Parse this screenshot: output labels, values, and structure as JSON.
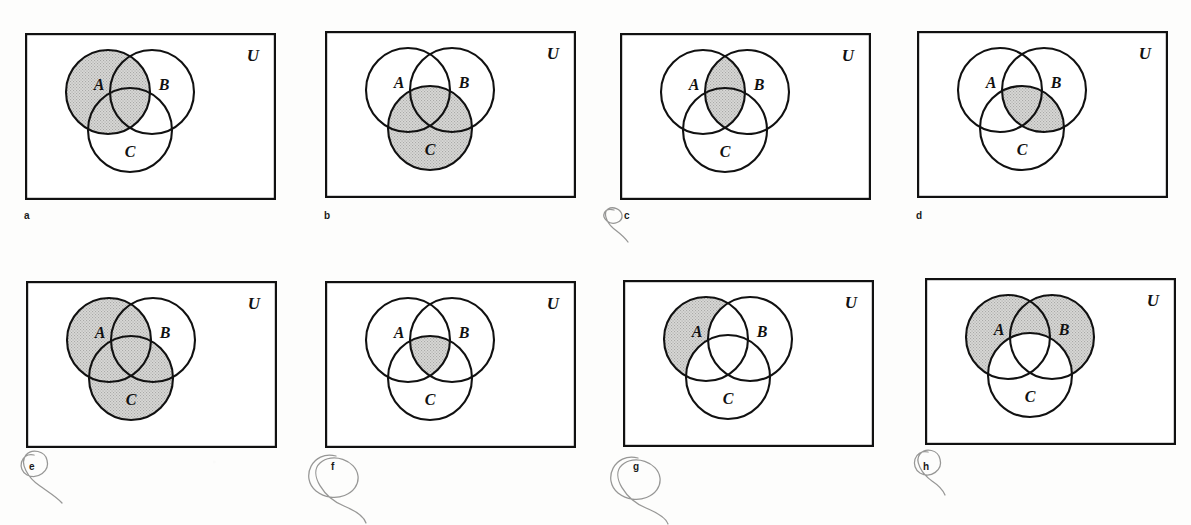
{
  "figure": {
    "kind": "venn-diagram-panel-grid",
    "panel_count": 8,
    "universe_label": "U",
    "set_labels": [
      "A",
      "B",
      "C"
    ],
    "shade_color": "#c9c9c9",
    "line_color": "#111111",
    "paper_color": "#fdfdfc"
  },
  "panels": [
    {
      "id": "a",
      "letter": "a",
      "universe_label": "U",
      "labels": {
        "a": "A",
        "b": "B",
        "c": "C"
      },
      "shaded_description": "A",
      "regions_shaded": [
        "A_only",
        "A_and_B_only",
        "A_and_C_only",
        "A_and_B_and_C"
      ],
      "box": {
        "x": 25,
        "y": 33,
        "w": 251,
        "h": 167
      },
      "letter_pos": {
        "x": 24,
        "y": 211
      }
    },
    {
      "id": "b",
      "letter": "b",
      "universe_label": "U",
      "labels": {
        "a": "A",
        "b": "B",
        "c": "C"
      },
      "shaded_description": "C",
      "regions_shaded": [
        "C_only",
        "A_and_C_only",
        "B_and_C_only",
        "A_and_B_and_C"
      ],
      "box": {
        "x": 325,
        "y": 31,
        "w": 251,
        "h": 167
      },
      "letter_pos": {
        "x": 324,
        "y": 211
      }
    },
    {
      "id": "c",
      "letter": "c",
      "universe_label": "U",
      "labels": {
        "a": "A",
        "b": "B",
        "c": "C"
      },
      "shaded_description": "A ∩ B",
      "regions_shaded": [
        "A_and_B_only",
        "A_and_B_and_C"
      ],
      "box": {
        "x": 620,
        "y": 33,
        "w": 251,
        "h": 167
      },
      "letter_pos": {
        "x": 624,
        "y": 211
      }
    },
    {
      "id": "d",
      "letter": "d",
      "universe_label": "U",
      "labels": {
        "a": "A",
        "b": "B",
        "c": "C"
      },
      "shaded_description": "B ∩ C",
      "regions_shaded": [
        "B_and_C_only",
        "A_and_B_and_C"
      ],
      "box": {
        "x": 917,
        "y": 31,
        "w": 251,
        "h": 167
      },
      "letter_pos": {
        "x": 916,
        "y": 211
      }
    },
    {
      "id": "e",
      "letter": "e",
      "universe_label": "U",
      "labels": {
        "a": "A",
        "b": "B",
        "c": "C"
      },
      "shaded_description": "A ∪ C",
      "regions_shaded": [
        "A_only",
        "C_only",
        "A_and_B_only",
        "A_and_C_only",
        "B_and_C_only",
        "A_and_B_and_C"
      ],
      "box": {
        "x": 26,
        "y": 281,
        "w": 251,
        "h": 167
      },
      "letter_pos": {
        "x": 29,
        "y": 462
      }
    },
    {
      "id": "f",
      "letter": "f",
      "universe_label": "U",
      "labels": {
        "a": "A",
        "b": "B",
        "c": "C"
      },
      "shaded_description": "A ∩ B ∩ C",
      "regions_shaded": [
        "A_and_B_and_C"
      ],
      "box": {
        "x": 325,
        "y": 281,
        "w": 251,
        "h": 167
      },
      "letter_pos": {
        "x": 331,
        "y": 462
      }
    },
    {
      "id": "g",
      "letter": "g",
      "universe_label": "U",
      "labels": {
        "a": "A",
        "b": "B",
        "c": "C"
      },
      "shaded_description": "A only (A minus B minus C)",
      "regions_shaded": [
        "A_only"
      ],
      "box": {
        "x": 623,
        "y": 280,
        "w": 251,
        "h": 167
      },
      "letter_pos": {
        "x": 633,
        "y": 462
      }
    },
    {
      "id": "h",
      "letter": "h",
      "universe_label": "U",
      "labels": {
        "a": "A",
        "b": "B",
        "c": "C"
      },
      "shaded_description": "(A ∪ B) minus C",
      "regions_shaded": [
        "A_only",
        "B_only",
        "A_and_B_only"
      ],
      "box": {
        "x": 925,
        "y": 278,
        "w": 251,
        "h": 167
      },
      "letter_pos": {
        "x": 923,
        "y": 462
      }
    }
  ],
  "geometry": {
    "radius": 42,
    "circle_a": {
      "cx": 83,
      "cy": 59
    },
    "circle_b": {
      "cx": 127,
      "cy": 59
    },
    "circle_c": {
      "cx": 105,
      "cy": 97
    },
    "label_a": {
      "x": 74,
      "y": 57
    },
    "label_b": {
      "x": 139,
      "y": 57
    },
    "label_c": {
      "x": 105,
      "y": 124
    },
    "label_u": {
      "x": 228,
      "y": 28
    }
  },
  "pencil_marks": [
    {
      "near_panel": "c",
      "shape": "loop"
    },
    {
      "near_panel": "e",
      "shape": "loop-with-tail"
    },
    {
      "near_panel": "f",
      "shape": "large-loop"
    },
    {
      "near_panel": "g",
      "shape": "large-loop"
    },
    {
      "near_panel": "h",
      "shape": "small-loop"
    }
  ]
}
